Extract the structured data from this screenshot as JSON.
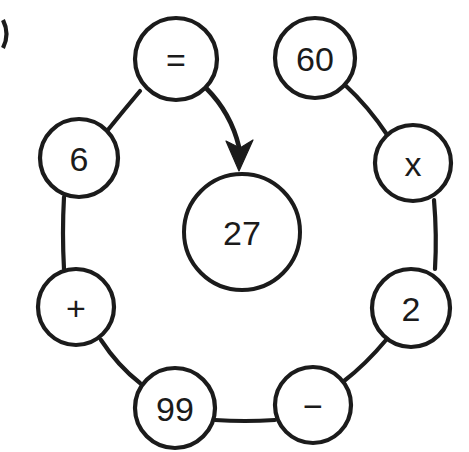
{
  "figure": {
    "background_color": "#ffffff",
    "stroke_color": "#1b1b1b",
    "width": 469,
    "height": 452
  },
  "center_node": {
    "id": "center",
    "label": "27",
    "cx": 242,
    "cy": 232,
    "r": 58
  },
  "ring_nodes": [
    {
      "id": "node-equals",
      "label": "=",
      "semantic": "equals-sign",
      "cx": 176,
      "cy": 59,
      "r": 41
    },
    {
      "id": "node-60",
      "label": "60",
      "semantic": "number-sixty",
      "cx": 315,
      "cy": 58,
      "r": 40
    },
    {
      "id": "node-x",
      "label": "x",
      "semantic": "multiply-sign",
      "cx": 413,
      "cy": 163,
      "r": 38
    },
    {
      "id": "node-2",
      "label": "2",
      "semantic": "number-two",
      "cx": 411,
      "cy": 308,
      "r": 39
    },
    {
      "id": "node-minus",
      "label": "−",
      "semantic": "minus-sign",
      "cx": 313,
      "cy": 405,
      "r": 38
    },
    {
      "id": "node-99",
      "label": "99",
      "semantic": "number-ninetynine",
      "cx": 175,
      "cy": 408,
      "r": 40
    },
    {
      "id": "node-plus",
      "label": "+",
      "semantic": "plus-sign",
      "cx": 76,
      "cy": 307,
      "r": 38
    },
    {
      "id": "node-6",
      "label": "6",
      "semantic": "number-six",
      "cx": 79,
      "cy": 158,
      "r": 39
    }
  ],
  "connections": [
    {
      "id": "link-6-equals",
      "from": "node-6",
      "to": "node-equals",
      "path": "M 107 131 Q 124 110 140 91"
    },
    {
      "id": "link-60-x",
      "from": "node-60",
      "to": "node-x",
      "path": "M 345 85 Q 368 106 388 136"
    },
    {
      "id": "link-x-2",
      "from": "node-x",
      "to": "node-2",
      "path": "M 434 200 Q 437 235 435 269"
    },
    {
      "id": "link-2-minus",
      "from": "node-2",
      "to": "node-minus",
      "path": "M 386 340 Q 366 364 344 381"
    },
    {
      "id": "link-minus-99",
      "from": "node-minus",
      "to": "node-99",
      "path": "M 275 420 Q 245 422 215 420"
    },
    {
      "id": "link-99-plus",
      "from": "node-99",
      "to": "node-plus",
      "path": "M 140 383 Q 118 366 101 340"
    },
    {
      "id": "link-plus-6",
      "from": "node-plus",
      "to": "node-6",
      "path": "M 64 269 Q 62 233 64 197"
    }
  ],
  "arrow": {
    "id": "arrow-equals-to-center",
    "from": "node-equals",
    "to": "center",
    "path": "M 206 88 Q 231 113 239 147",
    "head_points": "239,171 226,141 240,148 253,140"
  },
  "edge_fragment": {
    "id": "cropped-neighbor-circle",
    "description": "partial circle arc cropped at left image border",
    "path": "M 3 20 Q 10 34 3 48"
  }
}
